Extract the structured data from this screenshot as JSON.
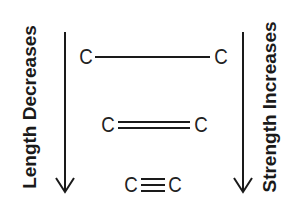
{
  "labels": {
    "left": "Length Decreases",
    "right": "Strength Increases"
  },
  "bonds": [
    {
      "type": "single",
      "atom1": "C",
      "atom2": "C"
    },
    {
      "type": "double",
      "atom1": "C",
      "atom2": "C"
    },
    {
      "type": "triple",
      "atom1": "C",
      "atom2": "C"
    }
  ],
  "colors": {
    "ink": "#1a1a1a",
    "background": "#ffffff"
  }
}
